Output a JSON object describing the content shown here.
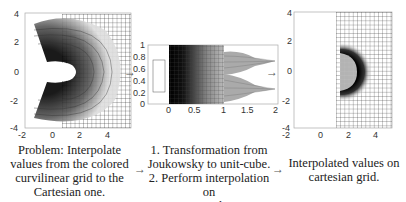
{
  "panels": {
    "left": {
      "title": "Curvilinear (Joukowsky) grid with Cartesian grid overlay",
      "x_ticks": [
        "-2",
        "0",
        "2",
        "4"
      ],
      "y_ticks": [
        "4",
        "2",
        "0",
        "-2",
        "-4"
      ]
    },
    "middle": {
      "title": "Unit-cube representation",
      "x_ticks": [
        "0",
        "0.5",
        "1",
        "1.5",
        "2"
      ],
      "y_ticks": [
        "1",
        "0.8",
        "0.6",
        "0.4",
        "0.2",
        "0"
      ]
    },
    "right": {
      "title": "Interpolated values on Cartesian grid",
      "x_ticks": [
        "-2",
        "0",
        "2",
        "4"
      ],
      "y_ticks": [
        "4",
        "2",
        "0",
        "-2",
        "-4"
      ]
    }
  },
  "captions": {
    "left": [
      "Problem: Interpolate",
      "values from the colored",
      "curvilinear grid to the",
      "Cartesian one."
    ],
    "middle": [
      "1. Transformation from",
      "Joukowsky to unit-cube.",
      "2. Perform interpolation on",
      "unit-cube."
    ],
    "right": [
      "Interpolated values on",
      "cartesian grid."
    ]
  },
  "arrows": {
    "glyph": "→"
  },
  "colors": {
    "axis": "#999999",
    "grid": "#222222",
    "fill_dark": "#000000"
  }
}
